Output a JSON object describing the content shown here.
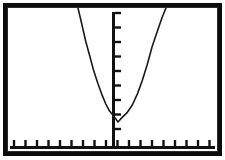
{
  "figure": {
    "kind": "graphing-calculator-screen",
    "frame_color": "#0b0b0b",
    "background_color": "#ffffff",
    "curve_color": "#1a1a1a",
    "axis_color": "#111111",
    "title": "",
    "alt_text": "Upward-opening parabola on a bordered calculator-style grid with tick-marked x and y axes"
  },
  "chart_data": {
    "type": "line",
    "title": "",
    "subtitle": "",
    "xlabel": "",
    "ylabel": "",
    "legend": [],
    "legend_position": "none",
    "grid": false,
    "axes": {
      "x_axis": {
        "position": "bottom",
        "visible": true,
        "tick_count": 18,
        "tick_direction": "up",
        "tick_length_px": 6,
        "tick_spacing_px": 11.5,
        "first_tick_px": 14,
        "labels_shown": false,
        "xlim": [
          -10,
          8
        ]
      },
      "y_axis": {
        "position": "x=113px",
        "visible": true,
        "tick_count": 9,
        "tick_direction": "right",
        "tick_length_px": 6,
        "tick_spacing_px": 14.5,
        "first_tick_px": 18,
        "labels_shown": false,
        "ylim": [
          -1,
          9
        ]
      }
    },
    "annotations": [],
    "series": [
      {
        "name": "parabola",
        "shape": "parabola-opening-upward",
        "vertex": [
          0.45,
          -0.4
        ],
        "vertex_px": [
          118,
          122
        ],
        "left_branch_exit_px": [
          78,
          8
        ],
        "right_branch_exit_px": [
          205,
          8
        ],
        "x": [
          -3.6,
          -3.2,
          -2.8,
          -2.4,
          -2.0,
          -1.6,
          -1.2,
          -0.8,
          -0.4,
          0.0,
          0.45,
          0.9,
          1.4,
          1.9,
          2.4,
          2.9,
          3.4,
          3.9,
          4.4,
          4.9,
          5.4
        ],
        "values": [
          9.0,
          7.6,
          6.2,
          5.0,
          3.8,
          2.8,
          1.9,
          1.1,
          0.5,
          0.1,
          -0.4,
          0.0,
          0.4,
          1.0,
          1.9,
          3.0,
          4.3,
          5.8,
          7.0,
          8.2,
          9.2
        ]
      }
    ]
  }
}
